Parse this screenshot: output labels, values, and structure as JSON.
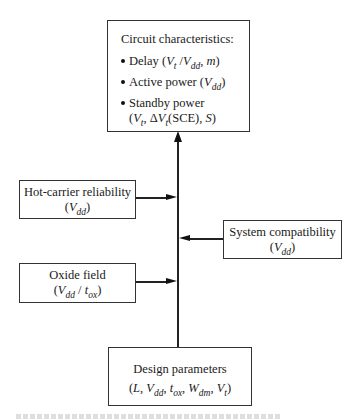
{
  "diagram": {
    "type": "flow-diagram",
    "central_axis": "vertical arrow from Design parameters up to Circuit characteristics",
    "top_box": {
      "title": "Circuit characteristics:",
      "items": [
        {
          "label": "Delay",
          "params_html": "(<i>V</i><sub>t</sub> /<i>V</i><sub>dd</sub>, <i>m</i>)"
        },
        {
          "label": "Active power",
          "params_html": "(<i>V</i><sub>dd</sub>)"
        },
        {
          "label": "Standby power",
          "params_html": "(<i>V</i><sub>t</sub>, Δ<i>V</i><sub>t</sub>(SCE), <i>S</i>)"
        }
      ]
    },
    "left_boxes": [
      {
        "title": "Hot-carrier reliability",
        "params_html": "(<i>V</i><sub>dd</sub>)",
        "arrow": "right"
      },
      {
        "title": "Oxide field",
        "params_html": "(<i>V</i><sub>dd</sub> / <i>t</i><sub>ox</sub>)",
        "arrow": "right"
      }
    ],
    "right_boxes": [
      {
        "title": "System compatibility",
        "params_html": "(<i>V</i><sub>dd</sub>)",
        "arrow": "left"
      }
    ],
    "bottom_box": {
      "title": "Design parameters",
      "params_html": "(<i>L</i>, <i>V</i><sub>dd</sub>, <i>t</i><sub>ox</sub>, <i>W</i><sub>dm</sub>, <i>V</i><sub>t</sub>)"
    },
    "caption": "(cut off, illegible)"
  }
}
